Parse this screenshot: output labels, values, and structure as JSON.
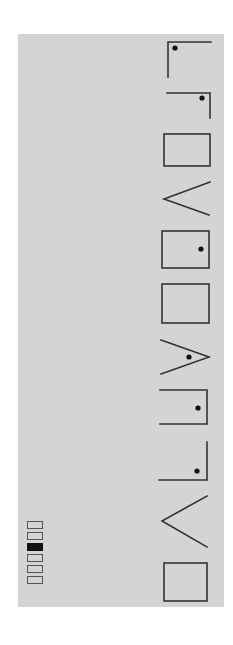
{
  "figure": {
    "background": "#ffffff",
    "panel_color": "#d4d4d4",
    "stroke_color": "#333333",
    "glyph_count": 11,
    "glyphs": [
      {
        "index": 1,
        "shape": "corner-top-left",
        "dot": true
      },
      {
        "index": 2,
        "shape": "corner-top-right",
        "dot": true
      },
      {
        "index": 3,
        "shape": "box",
        "dot": false
      },
      {
        "index": 4,
        "shape": "chevron-left",
        "dot": false
      },
      {
        "index": 5,
        "shape": "box",
        "dot": true
      },
      {
        "index": 6,
        "shape": "box",
        "dot": false
      },
      {
        "index": 7,
        "shape": "chevron-right",
        "dot": true
      },
      {
        "index": 8,
        "shape": "bracket-open-left",
        "dot": true
      },
      {
        "index": 9,
        "shape": "corner-bottom-right",
        "dot": true
      },
      {
        "index": 10,
        "shape": "chevron-left",
        "dot": false
      },
      {
        "index": 11,
        "shape": "box",
        "dot": false
      }
    ]
  },
  "legend": {
    "cells": [
      {
        "filled": false
      },
      {
        "filled": false
      },
      {
        "filled": true
      },
      {
        "filled": false
      },
      {
        "filled": false
      },
      {
        "filled": false
      }
    ],
    "active_index": 3
  }
}
